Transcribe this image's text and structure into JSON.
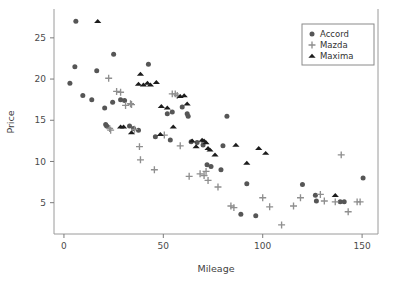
{
  "chart_data": {
    "type": "scatter",
    "title": "",
    "xlabel": "Mileage",
    "ylabel": "Price",
    "xlim": [
      -5,
      158
    ],
    "ylim": [
      1.2,
      28.5
    ],
    "xticks": [
      0,
      50,
      100,
      150
    ],
    "yticks": [
      5,
      10,
      15,
      20,
      25
    ],
    "grid": false,
    "legend_position": "top-right",
    "series": [
      {
        "name": "Accord",
        "marker": "circle",
        "color": "#565656",
        "points": [
          [
            3.0,
            19.5
          ],
          [
            5.5,
            21.5
          ],
          [
            6.0,
            27.0
          ],
          [
            9.5,
            18.0
          ],
          [
            14.0,
            17.5
          ],
          [
            16.5,
            21.0
          ],
          [
            20.5,
            16.5
          ],
          [
            21.0,
            14.5
          ],
          [
            21.5,
            14.3
          ],
          [
            24.5,
            17.2
          ],
          [
            25.0,
            23.0
          ],
          [
            28.5,
            17.5
          ],
          [
            30.5,
            17.4
          ],
          [
            33.0,
            14.3
          ],
          [
            35.0,
            14.0
          ],
          [
            37.5,
            13.8
          ],
          [
            42.5,
            21.8
          ],
          [
            46.0,
            13.0
          ],
          [
            52.0,
            15.8
          ],
          [
            53.5,
            12.6
          ],
          [
            54.5,
            16.0
          ],
          [
            59.5,
            16.6
          ],
          [
            62.0,
            15.8
          ],
          [
            62.5,
            15.5
          ],
          [
            64.0,
            12.4
          ],
          [
            67.0,
            12.3
          ],
          [
            70.0,
            12.0
          ],
          [
            72.0,
            9.6
          ],
          [
            74.0,
            9.4
          ],
          [
            79.0,
            9.0
          ],
          [
            80.0,
            11.9
          ],
          [
            82.0,
            15.5
          ],
          [
            89.0,
            3.6
          ],
          [
            92.0,
            7.3
          ],
          [
            96.5,
            3.4
          ],
          [
            120.0,
            7.2
          ],
          [
            126.5,
            5.9
          ],
          [
            127.0,
            5.2
          ],
          [
            139.0,
            5.1
          ],
          [
            141.0,
            5.1
          ],
          [
            150.5,
            8.0
          ]
        ]
      },
      {
        "name": "Mazda",
        "marker": "plus",
        "color": "#8f8f8f",
        "points": [
          [
            22.5,
            20.1
          ],
          [
            23.0,
            14.0
          ],
          [
            23.5,
            13.8
          ],
          [
            26.5,
            18.5
          ],
          [
            28.5,
            18.4
          ],
          [
            31.0,
            16.8
          ],
          [
            33.5,
            17.0
          ],
          [
            34.0,
            16.9
          ],
          [
            35.5,
            13.9
          ],
          [
            38.0,
            11.8
          ],
          [
            38.5,
            10.2
          ],
          [
            45.5,
            9.0
          ],
          [
            50.5,
            13.2
          ],
          [
            54.5,
            18.2
          ],
          [
            56.0,
            18.2
          ],
          [
            57.0,
            18.0
          ],
          [
            58.5,
            11.9
          ],
          [
            63.0,
            8.2
          ],
          [
            68.5,
            8.5
          ],
          [
            70.5,
            8.3
          ],
          [
            71.5,
            8.8
          ],
          [
            72.5,
            7.7
          ],
          [
            77.5,
            6.9
          ],
          [
            84.0,
            4.6
          ],
          [
            85.5,
            4.4
          ],
          [
            100.0,
            5.6
          ],
          [
            103.5,
            4.5
          ],
          [
            109.5,
            2.3
          ],
          [
            115.5,
            4.6
          ],
          [
            119.0,
            5.6
          ],
          [
            129.0,
            6.0
          ],
          [
            131.0,
            5.2
          ],
          [
            136.5,
            5.1
          ],
          [
            139.5,
            10.8
          ],
          [
            143.0,
            3.9
          ],
          [
            147.5,
            5.1
          ],
          [
            149.0,
            5.1
          ]
        ]
      },
      {
        "name": "Maxima",
        "marker": "triangle",
        "color": "#1c1c1c",
        "points": [
          [
            17.0,
            27.0
          ],
          [
            28.5,
            14.2
          ],
          [
            30.0,
            14.2
          ],
          [
            34.0,
            13.5
          ],
          [
            37.5,
            19.4
          ],
          [
            38.5,
            20.6
          ],
          [
            40.0,
            19.3
          ],
          [
            42.0,
            19.5
          ],
          [
            43.5,
            19.3
          ],
          [
            46.5,
            19.6
          ],
          [
            48.5,
            13.3
          ],
          [
            49.0,
            16.7
          ],
          [
            52.0,
            16.5
          ],
          [
            55.0,
            14.2
          ],
          [
            58.5,
            17.9
          ],
          [
            60.5,
            18.0
          ],
          [
            62.0,
            17.0
          ],
          [
            64.5,
            12.5
          ],
          [
            66.5,
            11.8
          ],
          [
            69.5,
            12.6
          ],
          [
            70.5,
            12.5
          ],
          [
            71.5,
            12.3
          ],
          [
            72.5,
            11.6
          ],
          [
            73.5,
            11.4
          ],
          [
            76.0,
            10.8
          ],
          [
            86.5,
            12.0
          ],
          [
            92.0,
            9.8
          ],
          [
            98.0,
            11.6
          ],
          [
            101.5,
            11.0
          ],
          [
            136.5,
            5.9
          ]
        ]
      }
    ]
  },
  "legend": {
    "entries": [
      {
        "label": "Accord",
        "marker": "circle-marker"
      },
      {
        "label": "Mazda",
        "marker": "plus-marker"
      },
      {
        "label": "Maxima",
        "marker": "triangle-marker"
      }
    ]
  },
  "axes": {
    "x_tick_labels": [
      "0",
      "50",
      "100",
      "150"
    ],
    "y_tick_labels": [
      "5",
      "10",
      "15",
      "20",
      "25"
    ],
    "x_axis_title": "Mileage",
    "y_axis_title": "Price"
  },
  "colors": {
    "accord": "#565656",
    "mazda": "#8f8f8f",
    "maxima": "#1c1c1c",
    "axis": "#9a9a9a",
    "text": "#4a4a4a",
    "background": "#ffffff"
  }
}
